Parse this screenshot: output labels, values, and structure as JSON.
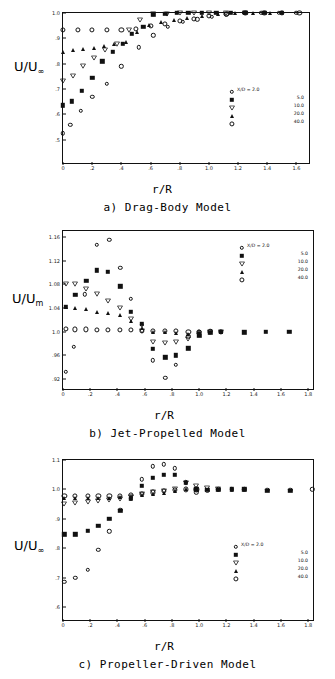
{
  "figure": {
    "panels": [
      {
        "id": "a",
        "caption": "a)  Drag-Body Model",
        "ylabel_main": "U/U",
        "ylabel_sub": "∞",
        "xlabel": "r/R"
      },
      {
        "id": "b",
        "caption": "b)  Jet-Propelled Model",
        "ylabel_main": "U/U",
        "ylabel_sub": "m",
        "xlabel": "r/R"
      },
      {
        "id": "c",
        "caption": "c) Propeller-Driven Model",
        "ylabel_main": "U/U",
        "ylabel_sub": "∞",
        "xlabel": "r/R"
      }
    ],
    "legend_title": "X/D = 2.0",
    "legend_entries": [
      {
        "label": "X/D = 2.0",
        "value": "2.0",
        "marker": "open-circle"
      },
      {
        "label": "5.0",
        "value": "5.0",
        "marker": "filled-square"
      },
      {
        "label": "10.0",
        "value": "10.0",
        "marker": "open-triangle-down"
      },
      {
        "label": "20.0",
        "value": "20.0",
        "marker": "filled-triangle-up"
      },
      {
        "label": "40.0",
        "value": "40.0",
        "marker": "open-circle-large"
      }
    ]
  },
  "chart_data": [
    {
      "type": "scatter",
      "title": "a)  Drag-Body Model",
      "xlabel": "r/R",
      "ylabel": "U/U∞",
      "xlim": [
        0,
        1.7
      ],
      "ylim": [
        0.4,
        1.0
      ],
      "xticks": [
        "0",
        ".2",
        ".4",
        ".6",
        ".8",
        "1.0",
        "1.2",
        "1.4",
        "1.6"
      ],
      "xtickvals": [
        0,
        0.2,
        0.4,
        0.6,
        0.8,
        1.0,
        1.2,
        1.4,
        1.6
      ],
      "yticks": [
        ".5",
        ".6",
        ".7",
        ".8",
        ".9",
        "1.0"
      ],
      "ytickvals": [
        0.5,
        0.6,
        0.7,
        0.8,
        0.9,
        1.0
      ],
      "grid": false,
      "legend_position": "inside-right",
      "series": [
        {
          "name": "X/D = 2.0",
          "marker": "open-circle",
          "x": [
            0.0,
            0.05,
            0.12,
            0.2,
            0.3,
            0.4,
            0.52,
            0.62,
            0.72,
            0.82,
            0.92,
            1.02,
            1.12,
            1.24,
            1.36,
            1.48,
            1.6
          ],
          "y": [
            0.525,
            0.558,
            0.615,
            0.668,
            0.72,
            0.79,
            0.865,
            0.912,
            0.945,
            0.965,
            0.975,
            0.985,
            0.995,
            1.0,
            1.0,
            1.0,
            1.0
          ]
        },
        {
          "name": "5.0",
          "marker": "filled-square",
          "x": [
            0.0,
            0.06,
            0.13,
            0.2,
            0.27,
            0.34,
            0.41,
            0.47,
            0.55,
            0.62,
            0.7,
            0.78,
            0.86,
            0.95,
            1.05,
            1.15,
            1.25,
            1.38,
            1.5
          ],
          "y": [
            0.635,
            0.652,
            0.693,
            0.744,
            0.81,
            0.848,
            0.878,
            0.918,
            0.945,
            0.995,
            0.998,
            1.0,
            1.0,
            1.0,
            1.0,
            1.0,
            1.0,
            1.0,
            1.0
          ]
        },
        {
          "name": "10.0",
          "marker": "open-triangle-down",
          "x": [
            0.0,
            0.07,
            0.14,
            0.21,
            0.29,
            0.37,
            0.45,
            0.53,
            0.62,
            0.71,
            0.8,
            0.9,
            1.0,
            1.12,
            1.25
          ],
          "y": [
            0.732,
            0.753,
            0.79,
            0.822,
            0.855,
            0.876,
            0.932,
            0.972,
            0.995,
            0.998,
            1.0,
            1.0,
            1.0,
            1.0,
            1.0
          ]
        },
        {
          "name": "20.0",
          "marker": "filled-triangle-up",
          "x": [
            0.0,
            0.07,
            0.14,
            0.21,
            0.28,
            0.35,
            0.43,
            0.51,
            0.59,
            0.67,
            0.76,
            0.85,
            0.95,
            1.06,
            1.18,
            1.3,
            1.42
          ],
          "y": [
            0.845,
            0.852,
            0.856,
            0.862,
            0.868,
            0.878,
            0.885,
            0.925,
            0.952,
            0.965,
            0.972,
            0.982,
            0.99,
            0.995,
            1.0,
            1.0,
            1.0
          ]
        },
        {
          "name": "40.0",
          "marker": "open-circle-large",
          "x": [
            0.0,
            0.1,
            0.2,
            0.3,
            0.4,
            0.5,
            0.6,
            0.7,
            0.8,
            0.9,
            1.0,
            1.12,
            1.25,
            1.38,
            1.5,
            1.62
          ],
          "y": [
            0.932,
            0.932,
            0.932,
            0.932,
            0.934,
            0.938,
            0.948,
            0.958,
            0.968,
            0.978,
            0.988,
            0.996,
            1.0,
            1.0,
            1.0,
            1.0
          ]
        }
      ]
    },
    {
      "type": "scatter",
      "title": "b)  Jet-Propelled Model",
      "xlabel": "r/R",
      "ylabel": "U/Um",
      "xlim": [
        0,
        1.85
      ],
      "ylim": [
        0.9,
        1.17
      ],
      "xticks": [
        "0",
        ".2",
        ".4",
        ".6",
        ".8",
        "1.0",
        "1.2",
        "1.4",
        "1.6",
        "1.8"
      ],
      "xtickvals": [
        0,
        0.2,
        0.4,
        0.6,
        0.8,
        1.0,
        1.2,
        1.4,
        1.6,
        1.8
      ],
      "yticks": [
        ".92",
        ".96",
        "1.0",
        "1.04",
        "1.08",
        "1.12",
        "1.16"
      ],
      "ytickvals": [
        0.92,
        0.96,
        1.0,
        1.04,
        1.08,
        1.12,
        1.16
      ],
      "grid": false,
      "legend_position": "inside-top-right",
      "series": [
        {
          "name": "X/D = 2.0",
          "marker": "open-circle",
          "x": [
            0.02,
            0.08,
            0.16,
            0.25,
            0.34,
            0.42,
            0.5,
            0.58,
            0.66,
            0.75,
            0.83,
            0.92,
            1.0,
            1.08,
            1.16
          ],
          "y": [
            0.932,
            0.975,
            1.063,
            1.147,
            1.155,
            1.108,
            1.056,
            1.012,
            0.952,
            0.922,
            0.944,
            0.992,
            1.0,
            1.002,
            1.0
          ]
        },
        {
          "name": "5.0",
          "marker": "filled-square",
          "x": [
            0.02,
            0.09,
            0.17,
            0.25,
            0.33,
            0.42,
            0.5,
            0.58,
            0.66,
            0.75,
            0.83,
            0.92,
            1.0,
            1.08,
            1.16,
            1.33,
            1.49,
            1.66
          ],
          "y": [
            1.042,
            1.062,
            1.086,
            1.104,
            1.101,
            1.077,
            1.034,
            1.013,
            0.971,
            0.957,
            0.96,
            0.972,
            0.993,
            0.998,
            1.0,
            0.999,
            1.0,
            1.0
          ]
        },
        {
          "name": "10.0",
          "marker": "open-triangle-down",
          "x": [
            0.02,
            0.09,
            0.17,
            0.25,
            0.33,
            0.42,
            0.5,
            0.58,
            0.66,
            0.75,
            0.83,
            0.92,
            1.0,
            1.08,
            1.16
          ],
          "y": [
            1.081,
            1.08,
            1.072,
            1.063,
            1.052,
            1.04,
            1.022,
            1.002,
            0.983,
            0.981,
            0.982,
            0.988,
            0.995,
            0.999,
            1.0
          ]
        },
        {
          "name": "20.0",
          "marker": "filled-triangle-up",
          "x": [
            0.02,
            0.09,
            0.17,
            0.25,
            0.33,
            0.42,
            0.5,
            0.58,
            0.66,
            0.75,
            0.83,
            0.92,
            1.0,
            1.08,
            1.16
          ],
          "y": [
            1.042,
            1.04,
            1.038,
            1.034,
            1.031,
            1.028,
            1.018,
            1.006,
            1.0,
            1.0,
            0.998,
            0.997,
            0.999,
            1.0,
            1.0
          ]
        },
        {
          "name": "40.0",
          "marker": "open-circle-large",
          "x": [
            0.02,
            0.09,
            0.17,
            0.25,
            0.33,
            0.42,
            0.5,
            0.58,
            0.66,
            0.75,
            0.83,
            0.92,
            1.0,
            1.08,
            1.16
          ],
          "y": [
            1.005,
            1.004,
            1.004,
            1.003,
            1.003,
            1.003,
            1.003,
            1.002,
            1.002,
            1.001,
            1.001,
            1.0,
            1.0,
            1.0,
            1.0
          ]
        }
      ]
    },
    {
      "type": "scatter",
      "title": "c) Propeller-Driven Model",
      "xlabel": "r/R",
      "ylabel": "U/U∞",
      "xlim": [
        0,
        1.85
      ],
      "ylim": [
        0.55,
        1.1
      ],
      "xticks": [
        "0",
        ".2",
        ".4",
        ".6",
        ".8",
        "1.0",
        "1.2",
        "1.4",
        "1.6",
        "1.8"
      ],
      "xtickvals": [
        0,
        0.2,
        0.4,
        0.6,
        0.8,
        1.0,
        1.2,
        1.4,
        1.6,
        1.8
      ],
      "yticks": [
        ".6",
        ".7",
        ".8",
        ".9",
        "1.0",
        "1.1"
      ],
      "ytickvals": [
        0.6,
        0.7,
        0.8,
        0.9,
        1.0,
        1.1
      ],
      "grid": false,
      "legend_position": "inside-right",
      "series": [
        {
          "name": "X/D = 2.0",
          "marker": "open-circle",
          "x": [
            0.01,
            0.09,
            0.18,
            0.26,
            0.34,
            0.42,
            0.5,
            0.58,
            0.66,
            0.74,
            0.82,
            0.9,
            0.98,
            1.06,
            1.14,
            1.24,
            1.33,
            1.5,
            1.67,
            1.83
          ],
          "y": [
            0.686,
            0.7,
            0.728,
            0.795,
            0.858,
            0.93,
            0.968,
            1.035,
            1.078,
            1.086,
            1.072,
            1.025,
            0.99,
            0.995,
            1.0,
            1.0,
            1.0,
            0.998,
            0.998,
            1.0
          ]
        },
        {
          "name": "5.0",
          "marker": "filled-square",
          "x": [
            0.01,
            0.09,
            0.18,
            0.26,
            0.34,
            0.42,
            0.5,
            0.58,
            0.66,
            0.74,
            0.82,
            0.9,
            0.98,
            1.06,
            1.14,
            1.24,
            1.33,
            1.5,
            1.67
          ],
          "y": [
            0.848,
            0.848,
            0.86,
            0.876,
            0.9,
            0.928,
            0.968,
            1.012,
            1.04,
            1.05,
            1.05,
            1.022,
            1.0,
            0.998,
            0.998,
            1.0,
            1.0,
            0.996,
            0.996
          ]
        },
        {
          "name": "10.0",
          "marker": "open-triangle-down",
          "x": [
            0.01,
            0.09,
            0.18,
            0.26,
            0.34,
            0.42,
            0.5,
            0.58,
            0.66,
            0.74,
            0.82,
            0.9,
            0.98,
            1.06,
            1.14
          ],
          "y": [
            0.952,
            0.955,
            0.958,
            0.962,
            0.965,
            0.968,
            0.975,
            0.985,
            0.99,
            0.995,
            1.0,
            1.022,
            1.012,
            1.005,
            1.0
          ]
        },
        {
          "name": "20.0",
          "marker": "filled-triangle-up",
          "x": [
            0.01,
            0.09,
            0.18,
            0.26,
            0.34,
            0.42,
            0.5,
            0.58,
            0.66,
            0.74,
            0.82,
            0.9,
            0.98
          ],
          "y": [
            0.972,
            0.972,
            0.972,
            0.972,
            0.972,
            0.974,
            0.978,
            0.982,
            0.985,
            0.988,
            0.995,
            1.0,
            1.0
          ]
        },
        {
          "name": "40.0",
          "marker": "open-circle-large",
          "x": [
            0.01,
            0.09,
            0.18,
            0.26,
            0.34,
            0.42,
            0.5,
            0.58,
            0.66,
            0.74,
            0.82,
            0.9,
            0.98
          ],
          "y": [
            0.978,
            0.978,
            0.978,
            0.978,
            0.978,
            0.978,
            0.982,
            0.986,
            0.99,
            0.994,
            0.998,
            1.0,
            1.0
          ]
        }
      ]
    }
  ]
}
